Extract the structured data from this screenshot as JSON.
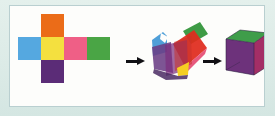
{
  "figure": {
    "background_color": "#dfeeea",
    "panel_color": "#fdfdfb",
    "panel_border_color": "#b9cfd0"
  },
  "stages": [
    {
      "id": "net",
      "label": "flat net"
    },
    {
      "id": "folding",
      "label": "partially folded"
    },
    {
      "id": "cube",
      "label": "closed cube"
    }
  ],
  "arrows": [
    {
      "id": "arrow-1",
      "label": "fold",
      "color": "#111014"
    },
    {
      "id": "arrow-2",
      "label": "fold",
      "color": "#111014"
    }
  ],
  "net": {
    "layout": "cross",
    "squares": [
      {
        "name": "top",
        "color_name": "orange",
        "color": "#eb6c18",
        "row": 0,
        "col": 1
      },
      {
        "name": "left",
        "color_name": "blue",
        "color": "#55a8e0",
        "row": 1,
        "col": 0
      },
      {
        "name": "center",
        "color_name": "yellow",
        "color": "#f4e03f",
        "row": 1,
        "col": 1
      },
      {
        "name": "right",
        "color_name": "pink",
        "color": "#ef5f86",
        "row": 1,
        "col": 2
      },
      {
        "name": "far-right",
        "color_name": "green",
        "color": "#4aa545",
        "row": 1,
        "col": 3
      },
      {
        "name": "bottom",
        "color_name": "purple",
        "color": "#5b2c77",
        "row": 2,
        "col": 1
      }
    ]
  },
  "folding": {
    "faces": [
      {
        "name": "blue-flap",
        "color": "#4f9fd8"
      },
      {
        "name": "purple-face",
        "color": "#6b3d85"
      },
      {
        "name": "red-face",
        "color": "#e02b1d"
      },
      {
        "name": "green-face",
        "color": "#3e9b45"
      },
      {
        "name": "yellow-tab",
        "color": "#f6cf22"
      },
      {
        "name": "pink-edge",
        "color": "#e4486f"
      }
    ]
  },
  "cube": {
    "faces": [
      {
        "name": "top-face",
        "color_name": "green",
        "color": "#3f9d4a"
      },
      {
        "name": "left-face",
        "color_name": "purple",
        "color": "#4b3a85"
      },
      {
        "name": "right-face",
        "color_name": "crimson",
        "color": "#c22a5c"
      }
    ],
    "edge_color": "#2b2340"
  }
}
